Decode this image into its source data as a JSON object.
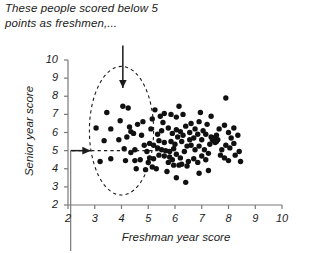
{
  "annotation": {
    "text": "These people scored below 5\npoints as freshmen,...",
    "arrow_down_label": "down-arrow-to-ellipse",
    "arrow_right_label": "right-arrow-from-y-axis"
  },
  "chart_data": {
    "type": "scatter",
    "title": "",
    "xlabel": "Freshman year score",
    "ylabel": "Senior year score",
    "xlim": [
      2,
      10
    ],
    "ylim": [
      2,
      10
    ],
    "xticks": [
      2,
      3,
      4,
      5,
      6,
      7,
      8,
      9,
      10
    ],
    "yticks": [
      2,
      3,
      4,
      5,
      6,
      7,
      8,
      9,
      10
    ],
    "grid": false,
    "legend": false,
    "marker_color": "#111111",
    "axis_color": "#7a7a7a",
    "annotations": [
      {
        "kind": "ellipse",
        "style": "dashed",
        "center_x": 4.0,
        "center_y": 6.1,
        "radius_x": 1.2,
        "radius_y": 3.55,
        "note": "highlights freshmen scoring below 5"
      },
      {
        "kind": "hline-dashed",
        "y": 5.0,
        "x_start": 2.15,
        "x_end": 5.6
      },
      {
        "kind": "vline-gray",
        "x": 2.1,
        "y_top": 5.0,
        "extends_below_axis": true
      },
      {
        "kind": "arrow-down",
        "x": 4.05,
        "y_from": 10.8,
        "y_to": 8.45
      },
      {
        "kind": "arrow-right",
        "y": 5.0,
        "x_from": 2.1,
        "x_to": 2.85
      }
    ],
    "points": [
      [
        3.45,
        7.1
      ],
      [
        4.05,
        7.45
      ],
      [
        4.25,
        7.35
      ],
      [
        3.95,
        6.65
      ],
      [
        3.6,
        6.2
      ],
      [
        4.3,
        6.3
      ],
      [
        4.45,
        5.95
      ],
      [
        4.35,
        6.05
      ],
      [
        4.75,
        5.85
      ],
      [
        5.1,
        6.2
      ],
      [
        4.1,
        5.1
      ],
      [
        4.5,
        5.05
      ],
      [
        3.6,
        4.55
      ],
      [
        4.15,
        4.45
      ],
      [
        4.5,
        4.45
      ],
      [
        4.7,
        4.5
      ],
      [
        5.0,
        4.35
      ],
      [
        5.15,
        4.1
      ],
      [
        4.95,
        4.95
      ],
      [
        5.35,
        5.9
      ],
      [
        5.45,
        6.9
      ],
      [
        5.6,
        7.05
      ],
      [
        5.55,
        6.55
      ],
      [
        5.85,
        7.0
      ],
      [
        6.15,
        7.45
      ],
      [
        5.5,
        6.1
      ],
      [
        5.75,
        6.25
      ],
      [
        5.9,
        5.95
      ],
      [
        6.05,
        6.15
      ],
      [
        6.2,
        6.05
      ],
      [
        5.4,
        5.55
      ],
      [
        5.6,
        5.45
      ],
      [
        5.85,
        5.5
      ],
      [
        6.0,
        5.35
      ],
      [
        6.25,
        5.5
      ],
      [
        5.35,
        5.15
      ],
      [
        5.5,
        5.05
      ],
      [
        5.65,
        5.0
      ],
      [
        5.8,
        4.95
      ],
      [
        5.95,
        5.1
      ],
      [
        5.4,
        4.75
      ],
      [
        5.6,
        4.7
      ],
      [
        5.8,
        4.65
      ],
      [
        6.05,
        4.8
      ],
      [
        6.2,
        4.6
      ],
      [
        6.35,
        4.95
      ],
      [
        6.45,
        5.25
      ],
      [
        6.55,
        5.6
      ],
      [
        6.4,
        6.35
      ],
      [
        6.6,
        6.5
      ],
      [
        6.75,
        6.2
      ],
      [
        6.9,
        6.6
      ],
      [
        6.85,
        5.9
      ],
      [
        7.05,
        6.1
      ],
      [
        7.2,
        6.45
      ],
      [
        6.5,
        4.4
      ],
      [
        6.7,
        4.55
      ],
      [
        6.85,
        4.35
      ],
      [
        7.0,
        4.7
      ],
      [
        7.15,
        4.5
      ],
      [
        7.3,
        5.35
      ],
      [
        7.45,
        5.55
      ],
      [
        7.35,
        5.75
      ],
      [
        7.55,
        5.85
      ],
      [
        7.5,
        5.45
      ],
      [
        7.4,
        5.6
      ],
      [
        7.6,
        5.6
      ],
      [
        7.45,
        5.7
      ],
      [
        7.55,
        5.5
      ],
      [
        7.65,
        6.2
      ],
      [
        7.85,
        6.4
      ],
      [
        8.0,
        6.0
      ],
      [
        7.9,
        5.3
      ],
      [
        8.05,
        5.15
      ],
      [
        8.2,
        5.4
      ],
      [
        7.7,
        4.75
      ],
      [
        7.85,
        4.6
      ],
      [
        8.0,
        4.45
      ],
      [
        8.25,
        4.75
      ],
      [
        8.4,
        4.95
      ],
      [
        7.9,
        7.9
      ],
      [
        7.35,
        6.9
      ],
      [
        6.95,
        7.1
      ],
      [
        6.3,
        7.0
      ],
      [
        6.05,
        6.85
      ],
      [
        5.3,
        4.0
      ],
      [
        5.7,
        3.85
      ],
      [
        6.05,
        3.5
      ],
      [
        6.4,
        3.25
      ],
      [
        6.9,
        3.75
      ],
      [
        7.25,
        3.9
      ],
      [
        5.95,
        4.2
      ],
      [
        6.15,
        4.2
      ],
      [
        4.9,
        3.95
      ],
      [
        4.55,
        4.0
      ],
      [
        3.2,
        4.4
      ],
      [
        3.35,
        5.55
      ],
      [
        3.05,
        6.25
      ],
      [
        4.6,
        6.45
      ],
      [
        4.8,
        6.6
      ],
      [
        5.15,
        6.75
      ],
      [
        5.25,
        7.25
      ],
      [
        5.05,
        5.4
      ],
      [
        4.85,
        5.3
      ],
      [
        5.2,
        5.3
      ],
      [
        6.1,
        5.75
      ],
      [
        6.3,
        5.85
      ],
      [
        6.6,
        5.3
      ],
      [
        6.75,
        5.05
      ],
      [
        6.9,
        5.25
      ],
      [
        7.1,
        5.05
      ],
      [
        7.25,
        4.85
      ],
      [
        8.35,
        5.85
      ],
      [
        8.2,
        6.25
      ],
      [
        8.45,
        4.4
      ],
      [
        5.75,
        4.35
      ],
      [
        5.9,
        4.5
      ],
      [
        6.25,
        4.25
      ],
      [
        6.45,
        4.15
      ],
      [
        4.35,
        4.9
      ],
      [
        3.9,
        5.6
      ],
      [
        4.2,
        5.75
      ],
      [
        5.05,
        4.6
      ],
      [
        5.2,
        4.55
      ],
      [
        7.0,
        5.6
      ],
      [
        7.15,
        5.9
      ],
      [
        6.7,
        5.7
      ],
      [
        6.55,
        6.0
      ],
      [
        8.1,
        5.7
      ],
      [
        7.75,
        5.05
      ]
    ]
  }
}
